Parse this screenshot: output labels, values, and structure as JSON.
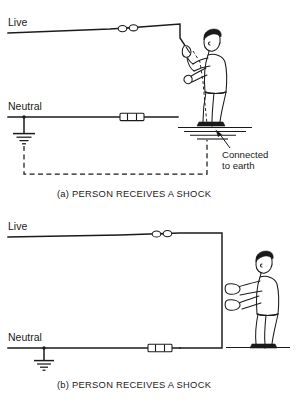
{
  "figure": {
    "background_color": "#ffffff",
    "line_color": "#1a1a1a"
  },
  "panel_a": {
    "id": "a",
    "caption": "(a)  PERSON RECEIVES A SHOCK",
    "live_label": "Live",
    "neutral_label": "Neutral",
    "annotation_line1": "Connected",
    "annotation_line2": "to earth",
    "live_connector": "two-bead-inline-connector",
    "neutral_connector": "fuse-cartridge-connector",
    "earth_symbol": "earth-ground-symbol",
    "return_path": "dashed-earth-return-path",
    "person_orientation": "facing-left",
    "person_contact": "one-hand-holding-live-wire-end"
  },
  "panel_b": {
    "id": "b",
    "caption": "(b)  PERSON RECEIVES A SHOCK",
    "live_label": "Live",
    "neutral_label": "Neutral",
    "live_connector": "two-bead-inline-connector",
    "neutral_connector": "fuse-cartridge-connector",
    "earth_symbol": "earth-ground-symbol",
    "person_orientation": "facing-left",
    "person_contact": "both-hands-gripping-vertical-wire"
  }
}
